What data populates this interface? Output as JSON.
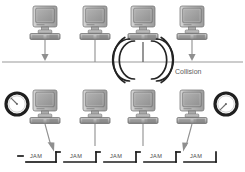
{
  "diagram": {
    "background_color": "#ffffff",
    "line_color": "#9a9a9a",
    "dark_line_color": "#3a3a3a",
    "body_color": "#b8b8b8",
    "screen_color": "#a8a8a8",
    "labels": {
      "collision": "Collision"
    },
    "top_row": {
      "bus_y": 62,
      "stations": [
        {
          "id": "station-1",
          "x": 45,
          "y": 8,
          "drop": "arrow"
        },
        {
          "id": "station-2",
          "x": 95,
          "y": 8,
          "drop": "line"
        },
        {
          "id": "station-3",
          "x": 143,
          "y": 8,
          "drop": "collision"
        },
        {
          "id": "station-4",
          "x": 192,
          "y": 8,
          "drop": "arrow"
        }
      ]
    },
    "bottom_row": {
      "bus_y": 152,
      "stations": [
        {
          "id": "station-5",
          "x": 45,
          "y": 92,
          "drop": "arrow"
        },
        {
          "id": "station-6",
          "x": 95,
          "y": 92,
          "drop": "line"
        },
        {
          "id": "station-7",
          "x": 143,
          "y": 92,
          "drop": "line"
        },
        {
          "id": "station-8",
          "x": 192,
          "y": 92,
          "drop": "arrow"
        }
      ],
      "clocks": [
        {
          "id": "clock-left",
          "cx": 17,
          "cy": 104,
          "r": 11,
          "hand_angle_deg": 225
        },
        {
          "id": "clock-right",
          "cx": 226,
          "cy": 104,
          "r": 11,
          "hand_angle_deg": 205
        }
      ],
      "jam_segments": [
        {
          "label": "JAM",
          "x": 30
        },
        {
          "label": "JAM",
          "x": 70
        },
        {
          "label": "JAM",
          "x": 110
        },
        {
          "label": "JAM",
          "x": 150
        },
        {
          "label": "JAM",
          "x": 190
        }
      ],
      "jam_arrows": [
        {
          "id": "jam-arrow-left",
          "x": 56
        },
        {
          "id": "jam-arrow-right",
          "x": 178
        }
      ]
    }
  }
}
